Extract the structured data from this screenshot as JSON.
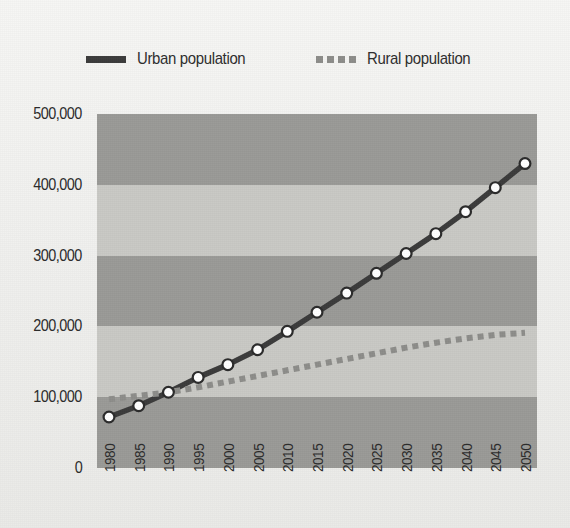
{
  "legend": {
    "items": [
      {
        "label": "Urban population",
        "key": "urban",
        "style": "solid",
        "color": "#3b3b3b",
        "icon": "solid-line-swatch"
      },
      {
        "label": "Rural population",
        "key": "rural",
        "style": "dashed",
        "color": "#8d8d8a",
        "icon": "dashed-line-swatch"
      }
    ]
  },
  "colors": {
    "urban_line": "#3b3b3b",
    "rural_line": "#8d8d8a",
    "marker_fill": "#ffffff",
    "marker_stroke": "#2b2b2b",
    "band_dark": "#9a9a97",
    "band_light": "#c9c9c5",
    "background": "#f1f1ef",
    "text": "#2b2b2b"
  },
  "chart_data": {
    "type": "line",
    "title": "",
    "subtitle": "",
    "xlabel": "",
    "ylabel": "",
    "grid": false,
    "banded_background": true,
    "legend_position": "top-center",
    "ylim": [
      0,
      500000
    ],
    "yticks": [
      0,
      100000,
      200000,
      300000,
      400000,
      500000
    ],
    "ytick_labels": [
      "0",
      "100,000",
      "200,000",
      "300,000",
      "400,000",
      "500,000"
    ],
    "x": [
      1980,
      1985,
      1990,
      1995,
      2000,
      2005,
      2010,
      2015,
      2020,
      2025,
      2030,
      2035,
      2040,
      2045,
      2050
    ],
    "xtick_labels": [
      "1980",
      "1985",
      "1990",
      "1995",
      "2000",
      "2005",
      "2010",
      "2015",
      "2020",
      "2025",
      "2030",
      "2035",
      "2040",
      "2045",
      "2050"
    ],
    "series": [
      {
        "name": "Urban population",
        "key": "urban",
        "style": "solid",
        "markers": true,
        "values": [
          72000,
          88000,
          107000,
          128000,
          146000,
          167000,
          193000,
          220000,
          247000,
          275000,
          303000,
          331000,
          362000,
          396000,
          430000
        ]
      },
      {
        "name": "Rural population",
        "key": "rural",
        "style": "dashed",
        "markers": false,
        "values": [
          97000,
          102000,
          107000,
          114000,
          122000,
          130000,
          138000,
          146000,
          154000,
          162000,
          170000,
          177000,
          183000,
          188000,
          191000
        ]
      }
    ]
  }
}
